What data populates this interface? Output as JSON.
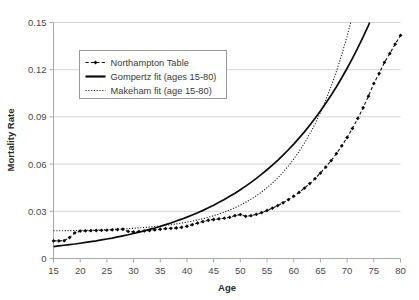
{
  "chart_data": {
    "type": "line",
    "title": "",
    "xlabel": "Age",
    "ylabel": "Mortality Rate",
    "xlim": [
      15,
      80
    ],
    "ylim": [
      0,
      0.15
    ],
    "xticks": [
      15,
      20,
      25,
      30,
      35,
      40,
      45,
      50,
      55,
      60,
      65,
      70,
      75,
      80
    ],
    "yticks": [
      0,
      0.03,
      0.06,
      0.09,
      0.12,
      0.15
    ],
    "xtick_labels": [
      "15",
      "20",
      "25",
      "30",
      "35",
      "40",
      "45",
      "50",
      "55",
      "60",
      "65",
      "70",
      "75",
      "80"
    ],
    "ytick_labels": [
      "0",
      "0.03",
      "0.06",
      "0.09",
      "0.12",
      "0.15"
    ],
    "grid": "horizontal",
    "legend_position": "upper-left-inside",
    "x": [
      15,
      16,
      17,
      18,
      19,
      20,
      21,
      22,
      23,
      24,
      25,
      26,
      27,
      28,
      29,
      30,
      31,
      32,
      33,
      34,
      35,
      36,
      37,
      38,
      39,
      40,
      41,
      42,
      43,
      44,
      45,
      46,
      47,
      48,
      49,
      50,
      51,
      52,
      53,
      54,
      55,
      56,
      57,
      58,
      59,
      60,
      61,
      62,
      63,
      64,
      65,
      66,
      67,
      68,
      69,
      70,
      71,
      72,
      73,
      74,
      75,
      76,
      77,
      78,
      79,
      80
    ],
    "series": [
      {
        "name": "Northampton Table",
        "style": "dashed-markers",
        "values": [
          0.0112,
          0.0112,
          0.0113,
          0.0133,
          0.0163,
          0.0174,
          0.0176,
          0.0177,
          0.0178,
          0.0179,
          0.018,
          0.0182,
          0.0184,
          0.0186,
          0.0172,
          0.0169,
          0.0172,
          0.0175,
          0.0178,
          0.0182,
          0.0186,
          0.019,
          0.0192,
          0.0194,
          0.0198,
          0.0205,
          0.0215,
          0.0225,
          0.0235,
          0.0243,
          0.0248,
          0.0252,
          0.0256,
          0.0262,
          0.0273,
          0.0279,
          0.0268,
          0.0272,
          0.0281,
          0.0292,
          0.0305,
          0.032,
          0.0336,
          0.0354,
          0.0374,
          0.0396,
          0.042,
          0.0447,
          0.0476,
          0.0508,
          0.0543,
          0.0581,
          0.0622,
          0.0667,
          0.0716,
          0.0769,
          0.0827,
          0.089,
          0.0958,
          0.1032,
          0.1112,
          0.1176,
          0.1247,
          0.1303,
          0.1362,
          0.1418
        ]
      },
      {
        "name": "Gompertz fit (ages 15-80)",
        "style": "solid",
        "values": [
          0.0076,
          0.008,
          0.0084,
          0.0088,
          0.0092,
          0.0097,
          0.0102,
          0.0107,
          0.0112,
          0.0118,
          0.0124,
          0.013,
          0.0137,
          0.0144,
          0.0151,
          0.0159,
          0.0167,
          0.0176,
          0.0185,
          0.0194,
          0.0204,
          0.0215,
          0.0226,
          0.0238,
          0.025,
          0.0263,
          0.0277,
          0.0291,
          0.0306,
          0.0322,
          0.0339,
          0.0357,
          0.0375,
          0.0395,
          0.0415,
          0.0437,
          0.046,
          0.0484,
          0.0509,
          0.0536,
          0.0564,
          0.0593,
          0.0624,
          0.0657,
          0.0691,
          0.0727,
          0.0765,
          0.0805,
          0.0847,
          0.0891,
          0.0938,
          0.0987,
          0.1038,
          0.1092,
          0.1149,
          0.1209,
          0.1272,
          0.1339,
          0.1409,
          0.1482,
          0.156,
          0.1641,
          0.1727,
          0.1817,
          0.1912,
          0.2012
        ]
      },
      {
        "name": "Makeham fit (age 15-80)",
        "style": "dotted",
        "values": [
          0.0176,
          0.0176,
          0.0177,
          0.0177,
          0.0178,
          0.0179,
          0.0179,
          0.018,
          0.0181,
          0.0182,
          0.0184,
          0.0185,
          0.0187,
          0.0188,
          0.019,
          0.0192,
          0.0195,
          0.0197,
          0.02,
          0.0203,
          0.0207,
          0.0211,
          0.0215,
          0.022,
          0.0225,
          0.0231,
          0.0238,
          0.0245,
          0.0253,
          0.0262,
          0.0272,
          0.0283,
          0.0295,
          0.0308,
          0.0323,
          0.0339,
          0.0357,
          0.0377,
          0.0399,
          0.0423,
          0.045,
          0.0479,
          0.0512,
          0.0548,
          0.0588,
          0.0632,
          0.068,
          0.0733,
          0.0792,
          0.0857,
          0.0928,
          0.1007,
          0.1094,
          0.119,
          0.1296,
          0.1413,
          0.1542,
          0.1684,
          0.1841,
          0.2014,
          0.2205,
          0.2416,
          0.2648,
          0.2904,
          0.3187,
          0.3499
        ]
      }
    ]
  },
  "legend": {
    "items": [
      {
        "label": "Northampton Table"
      },
      {
        "label": "Gompertz fit (ages 15-80)"
      },
      {
        "label": "Makeham fit (age 15-80)"
      }
    ]
  }
}
